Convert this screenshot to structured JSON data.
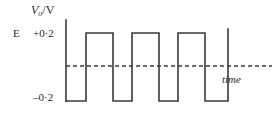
{
  "figure": {
    "axis_color": "#3a3a3a",
    "trace_color": "#3a3a3a",
    "zero_line_color": "#3a3a3a",
    "background": "#ffffff"
  },
  "labels": {
    "y_axis_symbol": "V",
    "y_axis_subscript": "o",
    "y_axis_separator": "/",
    "y_axis_unit": "V",
    "emf_marker": "E",
    "level_positive": "+0·2",
    "level_negative": "–0·2",
    "time_axis": "time"
  },
  "chart_data": {
    "type": "line",
    "title": "",
    "xlabel": "time",
    "ylabel": "V_o/V",
    "ylim": [
      -0.2,
      0.2
    ],
    "yticks": [
      0.2,
      -0.2
    ],
    "ytick_labels": [
      "+0·2",
      "–0·2"
    ],
    "grid": false,
    "legend": null,
    "zero_line": {
      "value": 0,
      "style": "dashed",
      "x_start_px": 66,
      "x_end_px": 272
    },
    "y_axis": {
      "x_px": 66,
      "top_px": 20,
      "bottom_px": 101
    },
    "waveform": {
      "description": "square wave alternating between -0.2 V and +0.2 V, starting low",
      "high_value": 0.2,
      "low_value": -0.2,
      "high_y_px": 33,
      "low_y_px": 101,
      "segments": [
        {
          "level": "low",
          "value": -0.2,
          "x_start_px": 66,
          "x_end_px": 86
        },
        {
          "level": "high",
          "value": 0.2,
          "x_start_px": 86,
          "x_end_px": 113
        },
        {
          "level": "low",
          "value": -0.2,
          "x_start_px": 113,
          "x_end_px": 132
        },
        {
          "level": "high",
          "value": 0.2,
          "x_start_px": 132,
          "x_end_px": 159
        },
        {
          "level": "low",
          "value": -0.2,
          "x_start_px": 159,
          "x_end_px": 178
        },
        {
          "level": "high",
          "value": 0.2,
          "x_start_px": 178,
          "x_end_px": 205
        },
        {
          "level": "low",
          "value": -0.2,
          "x_start_px": 205,
          "x_end_px": 228
        },
        {
          "level": "rise",
          "value": 0.2,
          "x_start_px": 228,
          "x_end_px": 228
        }
      ],
      "path": "M 66 101 L 86 101 L 86 33 L 113 33 L 113 101 L 132 101 L 132 33 L 159 33 L 159 101 L 178 101 L 178 33 L 205 33 L 205 101 L 228 101 L 228 29"
    }
  }
}
